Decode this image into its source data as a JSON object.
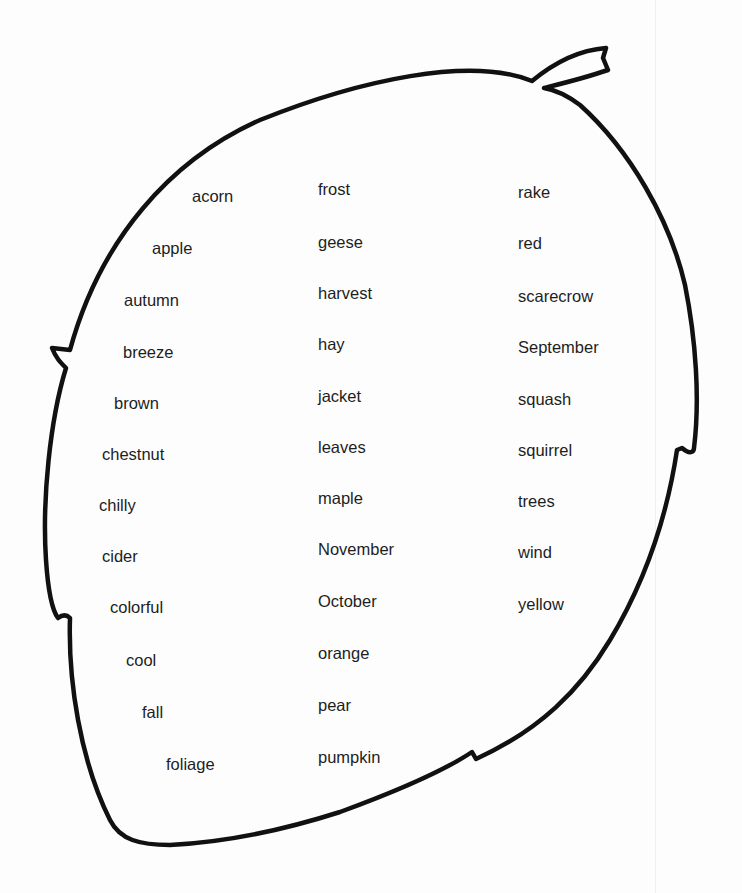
{
  "worksheet": {
    "shape": "leaf",
    "outline_color": "#111111",
    "columns": [
      {
        "words": [
          {
            "text": "acorn",
            "x": 192,
            "y": 196
          },
          {
            "text": "apple",
            "x": 152,
            "y": 248
          },
          {
            "text": "autumn",
            "x": 124,
            "y": 300
          },
          {
            "text": "breeze",
            "x": 123,
            "y": 352
          },
          {
            "text": "brown",
            "x": 114,
            "y": 403
          },
          {
            "text": "chestnut",
            "x": 102,
            "y": 454
          },
          {
            "text": "chilly",
            "x": 99,
            "y": 505
          },
          {
            "text": "cider",
            "x": 102,
            "y": 556
          },
          {
            "text": "colorful",
            "x": 110,
            "y": 607
          },
          {
            "text": "cool",
            "x": 126,
            "y": 660
          },
          {
            "text": "fall",
            "x": 142,
            "y": 712
          },
          {
            "text": "foliage",
            "x": 166,
            "y": 764
          }
        ]
      },
      {
        "words": [
          {
            "text": "frost",
            "x": 318,
            "y": 189
          },
          {
            "text": "geese",
            "x": 318,
            "y": 242
          },
          {
            "text": "harvest",
            "x": 318,
            "y": 293
          },
          {
            "text": "hay",
            "x": 318,
            "y": 344
          },
          {
            "text": "jacket",
            "x": 318,
            "y": 396
          },
          {
            "text": "leaves",
            "x": 318,
            "y": 447
          },
          {
            "text": "maple",
            "x": 318,
            "y": 498
          },
          {
            "text": "November",
            "x": 318,
            "y": 549
          },
          {
            "text": "October",
            "x": 318,
            "y": 601
          },
          {
            "text": "orange",
            "x": 318,
            "y": 653
          },
          {
            "text": "pear",
            "x": 318,
            "y": 705
          },
          {
            "text": "pumpkin",
            "x": 318,
            "y": 757
          }
        ]
      },
      {
        "words": [
          {
            "text": "rake",
            "x": 518,
            "y": 192
          },
          {
            "text": "red",
            "x": 518,
            "y": 243
          },
          {
            "text": "scarecrow",
            "x": 518,
            "y": 296
          },
          {
            "text": "September",
            "x": 518,
            "y": 347
          },
          {
            "text": "squash",
            "x": 518,
            "y": 399
          },
          {
            "text": "squirrel",
            "x": 518,
            "y": 450
          },
          {
            "text": "trees",
            "x": 518,
            "y": 501
          },
          {
            "text": "wind",
            "x": 518,
            "y": 552
          },
          {
            "text": "yellow",
            "x": 518,
            "y": 604
          }
        ]
      }
    ]
  }
}
